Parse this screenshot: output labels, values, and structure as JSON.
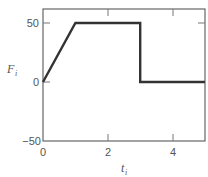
{
  "chart_data": {
    "type": "line",
    "title": "",
    "xlabel": "t",
    "xlabel_subscript": "i",
    "ylabel": "F",
    "ylabel_subscript": "i",
    "xlim": [
      0,
      5
    ],
    "ylim": [
      -50,
      60
    ],
    "x_ticks": [
      0,
      2,
      4
    ],
    "x_tick_labels": [
      "0",
      "2",
      "4"
    ],
    "y_ticks": [
      -50,
      0,
      50
    ],
    "y_tick_labels": [
      "−50",
      "0",
      "50"
    ],
    "grid": false,
    "legend": null,
    "series": [
      {
        "name": "F_i",
        "x": [
          0,
          1,
          3,
          3,
          5
        ],
        "y": [
          0,
          50,
          50,
          0,
          0
        ],
        "color": "#333333"
      }
    ]
  },
  "colors": {
    "line": "#333333",
    "axes": "#666666",
    "text": "#555555"
  }
}
